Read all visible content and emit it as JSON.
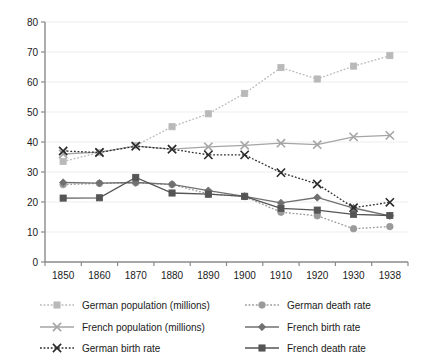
{
  "chart_data": {
    "type": "line",
    "title": "",
    "subtitle": "",
    "xlabel": "",
    "ylabel": "",
    "x": [
      "1850",
      "1860",
      "1870",
      "1880",
      "1890",
      "1900",
      "1910",
      "1920",
      "1930",
      "1938"
    ],
    "categories": [
      "1850",
      "1860",
      "1870",
      "1880",
      "1890",
      "1900",
      "1910",
      "1920",
      "1930",
      "1938"
    ],
    "ylim": [
      0,
      80
    ],
    "yticks": [
      0,
      10,
      20,
      30,
      40,
      50,
      60,
      70,
      80
    ],
    "ytick_labels": [
      "0",
      "10",
      "20",
      "30",
      "40",
      "50",
      "60",
      "70",
      "80"
    ],
    "grid": true,
    "grid_axis": "y",
    "legend_position": "bottom",
    "legend_columns": 2,
    "series": [
      {
        "name": "German population (millions)",
        "values": [
          33.5,
          36.5,
          38.8,
          45.1,
          49.4,
          56.2,
          64.8,
          61.0,
          65.3,
          68.8
        ],
        "color": "#b9b9b9",
        "line_style": "dotted",
        "marker": "square"
      },
      {
        "name": "German death rate",
        "values": [
          25.8,
          26.2,
          26.4,
          25.8,
          22.7,
          21.8,
          16.6,
          15.4,
          11.1,
          11.8
        ],
        "color": "#9a9a9a",
        "line_style": "dotted",
        "marker": "circle"
      },
      {
        "name": "French population (millions)",
        "values": [
          36.0,
          36.6,
          38.6,
          37.6,
          38.4,
          38.9,
          39.6,
          39.1,
          41.7,
          42.2
        ],
        "color": "#a5a5a5",
        "line_style": "solid",
        "marker": "cross"
      },
      {
        "name": "French birth rate",
        "values": [
          26.5,
          26.3,
          26.5,
          25.9,
          23.8,
          21.9,
          19.7,
          21.5,
          18.0,
          15.4
        ],
        "color": "#707070",
        "line_style": "solid",
        "marker": "diamond"
      },
      {
        "name": "German birth rate",
        "values": [
          37.0,
          36.5,
          38.6,
          37.6,
          35.7,
          35.7,
          29.8,
          26.0,
          18.1,
          19.9
        ],
        "color": "#2b2b2b",
        "line_style": "dotted",
        "marker": "cross"
      },
      {
        "name": "French death rate",
        "values": [
          21.3,
          21.4,
          28.2,
          23.0,
          22.6,
          21.9,
          17.9,
          17.3,
          15.9,
          15.5
        ],
        "color": "#555555",
        "line_style": "solid",
        "marker": "square"
      }
    ],
    "legend_entries": [
      "German population (millions)",
      "German death rate",
      "French population (millions)",
      "French birth rate",
      "German birth rate",
      "French death rate"
    ]
  }
}
